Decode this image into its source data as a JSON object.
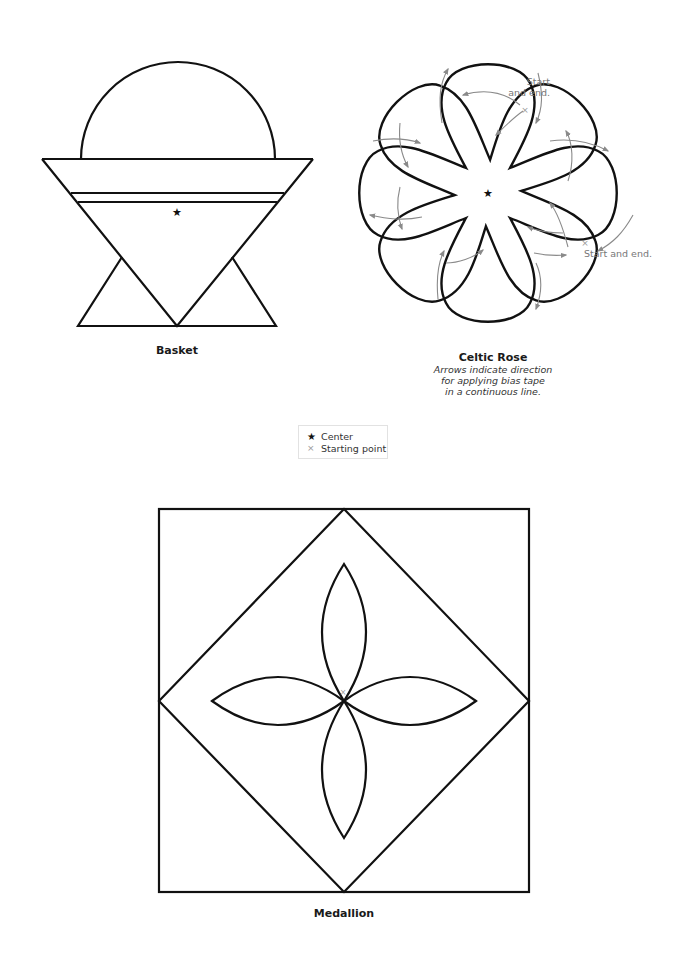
{
  "diagrams": {
    "basket": {
      "title": "Basket"
    },
    "celtic_rose": {
      "title": "Celtic Rose",
      "subtitle_lines": [
        "Arrows indicate direction",
        "for applying bias tape",
        "in a continuous line."
      ],
      "annotations": {
        "top": [
          "Start",
          "and end."
        ],
        "right": "Start and end."
      }
    },
    "medallion": {
      "title": "Medallion"
    }
  },
  "legend": {
    "items": [
      {
        "icon": "star-icon",
        "symbol": "★",
        "label": "Center"
      },
      {
        "icon": "cross-icon",
        "symbol": "×",
        "label": "Starting point"
      }
    ]
  },
  "colors": {
    "stroke": "#111111",
    "arrow": "#8a8a8a",
    "text_muted": "#777777"
  }
}
